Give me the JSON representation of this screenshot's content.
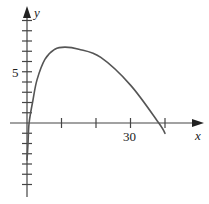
{
  "chart_data": {
    "type": "line",
    "title": "",
    "xlabel": "x",
    "ylabel": "y",
    "x_tick_labels": [
      {
        "value": 30,
        "label": "30"
      }
    ],
    "y_tick_labels": [
      {
        "value": 5,
        "label": "5"
      }
    ],
    "x_ticks": [
      10,
      20,
      30,
      40
    ],
    "y_ticks": [
      -6,
      -5,
      -4,
      -3,
      -2,
      -1,
      1,
      2,
      3,
      4,
      5,
      6,
      7,
      8,
      9,
      10
    ],
    "xlim": [
      -5,
      50
    ],
    "ylim": [
      -7,
      11
    ],
    "grid": false,
    "legend": null,
    "series": [
      {
        "name": "curve",
        "color": "#555555",
        "points": [
          [
            0.0,
            -3.6
          ],
          [
            0.3,
            -2.0
          ],
          [
            0.6,
            0.0
          ],
          [
            1.7,
            2.2
          ],
          [
            2.9,
            4.2
          ],
          [
            5.2,
            6.2
          ],
          [
            8.1,
            7.2
          ],
          [
            11.0,
            7.4
          ],
          [
            15.0,
            7.2
          ],
          [
            21.4,
            6.4
          ],
          [
            30.0,
            3.7
          ],
          [
            38.2,
            0.0
          ],
          [
            40.0,
            -1.0
          ]
        ]
      }
    ]
  },
  "labels": {
    "x_axis": "x",
    "y_axis": "y",
    "x_tick_30": "30",
    "y_tick_5": "5"
  }
}
